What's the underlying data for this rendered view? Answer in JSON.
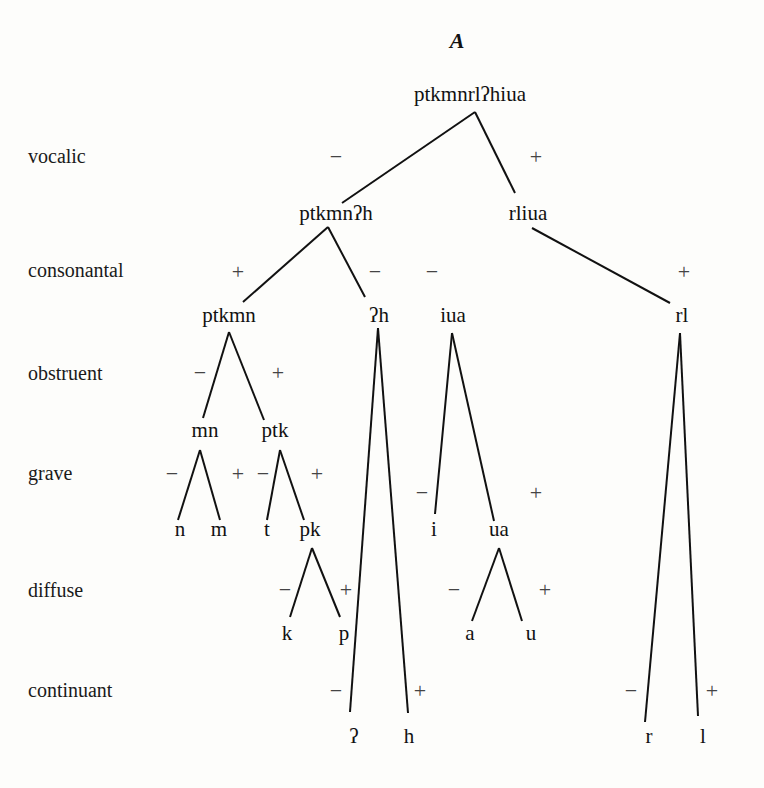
{
  "title": "A",
  "features": [
    {
      "label": "vocalic",
      "x": 28,
      "y": 163
    },
    {
      "label": "consonantal",
      "x": 28,
      "y": 277
    },
    {
      "label": "obstruent",
      "x": 28,
      "y": 380
    },
    {
      "label": "grave",
      "x": 28,
      "y": 480
    },
    {
      "label": "diffuse",
      "x": 28,
      "y": 597
    },
    {
      "label": "continuant",
      "x": 28,
      "y": 697
    }
  ],
  "nodes": [
    {
      "id": "root",
      "text": "ptkmnrlʔhiua",
      "x": 470,
      "y": 101
    },
    {
      "id": "ptkmnʔh",
      "text": "ptkmnʔh",
      "x": 336,
      "y": 220
    },
    {
      "id": "rliua",
      "text": "rliua",
      "x": 528,
      "y": 220
    },
    {
      "id": "ptkmn",
      "text": "ptkmn",
      "x": 229,
      "y": 322
    },
    {
      "id": "ʔh",
      "text": "ʔh",
      "x": 379,
      "y": 322
    },
    {
      "id": "iua",
      "text": "iua",
      "x": 453,
      "y": 322
    },
    {
      "id": "rl",
      "text": "rl",
      "x": 682,
      "y": 322
    },
    {
      "id": "mn",
      "text": "mn",
      "x": 205,
      "y": 437
    },
    {
      "id": "ptk",
      "text": "ptk",
      "x": 275,
      "y": 437
    },
    {
      "id": "n",
      "text": "n",
      "x": 180,
      "y": 536
    },
    {
      "id": "m",
      "text": "m",
      "x": 219,
      "y": 536
    },
    {
      "id": "t",
      "text": "t",
      "x": 267,
      "y": 536
    },
    {
      "id": "pk",
      "text": "pk",
      "x": 310,
      "y": 536
    },
    {
      "id": "i",
      "text": "i",
      "x": 434,
      "y": 536
    },
    {
      "id": "ua",
      "text": "ua",
      "x": 499,
      "y": 536
    },
    {
      "id": "k",
      "text": "k",
      "x": 287,
      "y": 640
    },
    {
      "id": "p",
      "text": "p",
      "x": 344,
      "y": 640
    },
    {
      "id": "a",
      "text": "a",
      "x": 470,
      "y": 640
    },
    {
      "id": "u",
      "text": "u",
      "x": 531,
      "y": 640
    },
    {
      "id": "ʔ",
      "text": "ʔ",
      "x": 354,
      "y": 743
    },
    {
      "id": "h",
      "text": "h",
      "x": 409,
      "y": 743
    },
    {
      "id": "r",
      "text": "r",
      "x": 649,
      "y": 743
    },
    {
      "id": "l",
      "text": "l",
      "x": 703,
      "y": 743
    }
  ],
  "edges": [
    [
      475,
      112,
      342,
      203
    ],
    [
      475,
      112,
      515,
      193
    ],
    [
      328,
      227,
      243,
      302
    ],
    [
      328,
      227,
      365,
      297
    ],
    [
      532,
      228,
      670,
      303
    ],
    [
      229,
      332,
      203,
      418
    ],
    [
      229,
      332,
      264,
      420
    ],
    [
      378,
      328,
      350,
      712
    ],
    [
      378,
      328,
      408,
      713
    ],
    [
      452,
      333,
      435,
      514
    ],
    [
      452,
      333,
      494,
      521
    ],
    [
      680,
      333,
      645,
      722
    ],
    [
      680,
      333,
      698,
      716
    ],
    [
      200,
      450,
      178,
      520
    ],
    [
      200,
      450,
      220,
      520
    ],
    [
      280,
      450,
      267,
      520
    ],
    [
      280,
      450,
      304,
      520
    ],
    [
      312,
      548,
      290,
      617
    ],
    [
      312,
      548,
      340,
      617
    ],
    [
      499,
      548,
      472,
      621
    ],
    [
      499,
      548,
      522,
      621
    ]
  ],
  "signs": [
    {
      "text": "−",
      "x": 336,
      "y": 164
    },
    {
      "text": "+",
      "x": 536,
      "y": 164
    },
    {
      "text": "+",
      "x": 238,
      "y": 279
    },
    {
      "text": "−",
      "x": 375,
      "y": 279
    },
    {
      "text": "−",
      "x": 432,
      "y": 279
    },
    {
      "text": "+",
      "x": 684,
      "y": 279
    },
    {
      "text": "−",
      "x": 200,
      "y": 380
    },
    {
      "text": "+",
      "x": 278,
      "y": 380
    },
    {
      "text": "−",
      "x": 172,
      "y": 481
    },
    {
      "text": "+",
      "x": 238,
      "y": 481
    },
    {
      "text": "−",
      "x": 263,
      "y": 481
    },
    {
      "text": "+",
      "x": 317,
      "y": 481
    },
    {
      "text": "−",
      "x": 422,
      "y": 500
    },
    {
      "text": "+",
      "x": 536,
      "y": 500
    },
    {
      "text": "−",
      "x": 285,
      "y": 597
    },
    {
      "text": "+",
      "x": 346,
      "y": 597
    },
    {
      "text": "−",
      "x": 454,
      "y": 597
    },
    {
      "text": "+",
      "x": 545,
      "y": 597
    },
    {
      "text": "−",
      "x": 336,
      "y": 698
    },
    {
      "text": "+",
      "x": 420,
      "y": 698
    },
    {
      "text": "−",
      "x": 631,
      "y": 698
    },
    {
      "text": "+",
      "x": 712,
      "y": 698
    }
  ]
}
